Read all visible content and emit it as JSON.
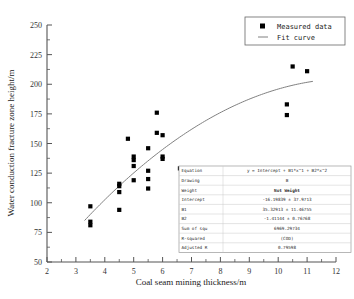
{
  "chart_data": {
    "type": "scatter",
    "title": "",
    "xlabel": "Coal seam mining thickness/m",
    "ylabel": "Water conduction fracture zone height/m",
    "xlim": [
      2,
      12
    ],
    "ylim": [
      50,
      250
    ],
    "xticks": [
      2,
      3,
      4,
      5,
      6,
      7,
      8,
      9,
      10,
      11,
      12
    ],
    "yticks": [
      50,
      75,
      100,
      125,
      150,
      175,
      200,
      225,
      250
    ],
    "xtick_labels": [
      "2",
      "3",
      "4",
      "5",
      "6",
      "7",
      "8",
      "9",
      "10",
      "11",
      "12"
    ],
    "ytick_labels": [
      "50",
      "75",
      "100",
      "125",
      "150",
      "175",
      "200",
      "225",
      "250"
    ],
    "minor_ticks": true,
    "grid": false,
    "legend_position": "top-right",
    "series": [
      {
        "name": "Measured data",
        "type": "scatter",
        "marker": "square",
        "color": "#000000",
        "points": [
          [
            3.5,
            97
          ],
          [
            3.5,
            84
          ],
          [
            3.5,
            81
          ],
          [
            4.5,
            116
          ],
          [
            4.5,
            114
          ],
          [
            4.5,
            109
          ],
          [
            4.5,
            94
          ],
          [
            4.8,
            154
          ],
          [
            5.0,
            139
          ],
          [
            5.0,
            136
          ],
          [
            5.0,
            131
          ],
          [
            5.0,
            119
          ],
          [
            5.5,
            146
          ],
          [
            5.5,
            127
          ],
          [
            5.5,
            120
          ],
          [
            5.5,
            112
          ],
          [
            5.8,
            176
          ],
          [
            5.8,
            159
          ],
          [
            6.0,
            157
          ],
          [
            6.0,
            139
          ],
          [
            6.0,
            137
          ],
          [
            6.6,
            129
          ],
          [
            10.3,
            183
          ],
          [
            10.3,
            174
          ],
          [
            10.5,
            215
          ],
          [
            11.0,
            211
          ]
        ]
      },
      {
        "name": "Fit curve",
        "type": "line",
        "color": "#808080",
        "model": "y = Intercept + B1*x^1 + B2*x^2",
        "coefficients": {
          "intercept": -16.19839,
          "B1": 35.32913,
          "B2": -1.41144
        },
        "x_range": [
          3.3,
          11.2
        ]
      }
    ]
  },
  "legend": {
    "items": [
      {
        "label": "Measured data",
        "marker": "square"
      },
      {
        "label": "Fit curve",
        "marker": "line"
      }
    ]
  },
  "stats_table": {
    "rows": [
      {
        "label": "Equation",
        "value": "y = Intercept + B1*x^1 + B2*x^2",
        "bold": false
      },
      {
        "label": "Drawing",
        "value": "B",
        "bold": false
      },
      {
        "label": "Weight",
        "value": "Not Weight",
        "bold": true
      },
      {
        "label": "Intercept",
        "value": "-16.19839 ± 37.9713",
        "bold": false
      },
      {
        "label": "B1",
        "value": "35.32913 ± 11.46755",
        "bold": false
      },
      {
        "label": "B2",
        "value": "-1.41144 ± 0.76768",
        "bold": false
      },
      {
        "label": "Sum of squ",
        "value": "6969.29734",
        "bold": false
      },
      {
        "label": "R-squared",
        "value": "(COD)",
        "bold": false
      },
      {
        "label": "Adjusted R",
        "value": "0.79598",
        "bold": false
      }
    ]
  },
  "colors": {
    "axis": "#333333",
    "marker": "#000000",
    "fit_curve": "#808080",
    "frame": "#555555",
    "table_border": "#9a9a9a",
    "background": "#ffffff"
  }
}
